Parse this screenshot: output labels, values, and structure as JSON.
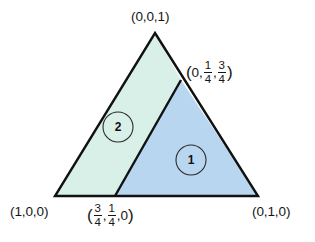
{
  "figure": {
    "background_color": "#ffffff",
    "outline_color": "#111111",
    "vertices": {
      "top": {
        "label": "(0,0,1)",
        "x": 155,
        "y": 33
      },
      "bottom_left": {
        "label": "(1,0,0)",
        "x": 55,
        "y": 196
      },
      "bottom_right": {
        "label": "(0,1,0)",
        "x": 258,
        "y": 196
      }
    },
    "divider": {
      "from": {
        "x": 115,
        "y": 196
      },
      "to": {
        "x": 181,
        "y": 80
      }
    },
    "regions": [
      {
        "id": "region-2",
        "label": "2",
        "fill_color": "#d8f0e7",
        "circle_center": {
          "x": 118,
          "y": 127
        },
        "circle_radius": 15
      },
      {
        "id": "region-1",
        "label": "1",
        "fill_color": "#b9d6f0",
        "circle_center": {
          "x": 191,
          "y": 160
        },
        "circle_radius": 15
      }
    ],
    "labels": {
      "top_vertex": "(0,0,1)",
      "bottom_left_vertex": "(1,0,0)",
      "bottom_right_vertex": "(0,1,0)",
      "right_edge_point": {
        "open_paren": "(",
        "first": "0",
        "comma1": ",",
        "second_num": "1",
        "second_den": "4",
        "comma2": ",",
        "third_num": "3",
        "third_den": "4",
        "close_paren": ")",
        "plain": "(0, 1/4, 3/4)"
      },
      "bottom_edge_point": {
        "open_paren": "(",
        "first_num": "3",
        "first_den": "4",
        "comma1": ",",
        "second_num": "1",
        "second_den": "4",
        "comma2": ",",
        "third": "0",
        "close_paren": ")",
        "plain": "(3/4, 1/4, 0)"
      }
    }
  }
}
